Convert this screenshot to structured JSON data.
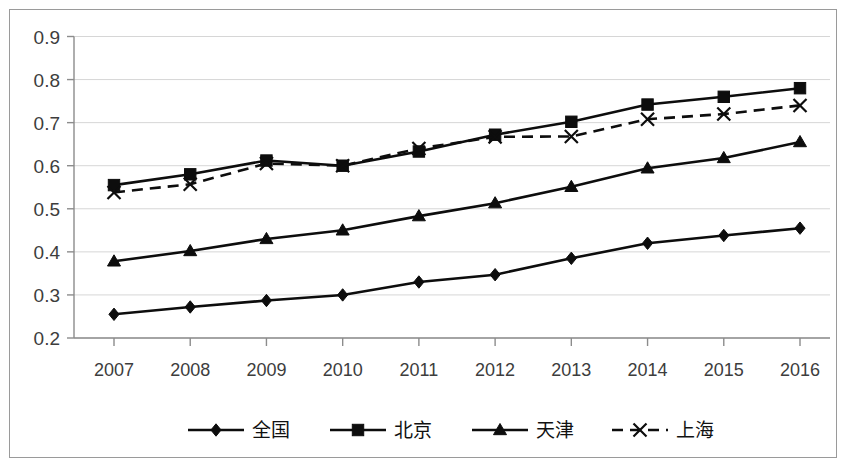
{
  "chart_data": {
    "type": "line",
    "title": "",
    "xlabel": "",
    "ylabel": "",
    "categories": [
      "2007",
      "2008",
      "2009",
      "2010",
      "2011",
      "2012",
      "2013",
      "2014",
      "2015",
      "2016"
    ],
    "ylim": [
      0.2,
      0.9
    ],
    "yticks": [
      "0.2",
      "0.3",
      "0.4",
      "0.5",
      "0.6",
      "0.7",
      "0.8",
      "0.9"
    ],
    "ytick_values": [
      0.2,
      0.3,
      0.4,
      0.5,
      0.6,
      0.7,
      0.8,
      0.9
    ],
    "grid": true,
    "legend_position": "bottom",
    "series": [
      {
        "name": "全国",
        "marker": "diamond",
        "line_style": "solid",
        "color": "#0d0d0d",
        "values": [
          0.255,
          0.272,
          0.287,
          0.3,
          0.33,
          0.347,
          0.385,
          0.42,
          0.438,
          0.455
        ]
      },
      {
        "name": "北京",
        "marker": "square",
        "line_style": "solid",
        "color": "#0d0d0d",
        "values": [
          0.555,
          0.58,
          0.612,
          0.6,
          0.633,
          0.672,
          0.702,
          0.742,
          0.76,
          0.78
        ]
      },
      {
        "name": "天津",
        "marker": "triangle",
        "line_style": "solid",
        "color": "#0d0d0d",
        "values": [
          0.378,
          0.402,
          0.43,
          0.45,
          0.483,
          0.513,
          0.551,
          0.594,
          0.618,
          0.655
        ]
      },
      {
        "name": "上海",
        "marker": "x",
        "line_style": "dashed",
        "color": "#0d0d0d",
        "values": [
          0.538,
          0.557,
          0.605,
          0.6,
          0.64,
          0.667,
          0.668,
          0.708,
          0.72,
          0.74
        ]
      }
    ]
  },
  "legend": {
    "items": [
      {
        "label": "全国"
      },
      {
        "label": "北京"
      },
      {
        "label": "天津"
      },
      {
        "label": "上海"
      }
    ]
  }
}
